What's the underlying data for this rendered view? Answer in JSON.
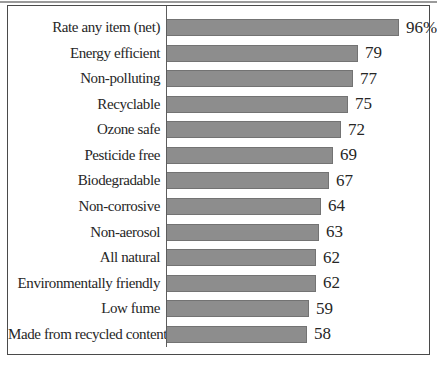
{
  "chart_data": {
    "type": "bar",
    "orientation": "horizontal",
    "title": "",
    "xlabel": "",
    "ylabel": "",
    "xlim": [
      0,
      96
    ],
    "grid": false,
    "legend": null,
    "categories": [
      "Rate any item (net)",
      "Energy efficient",
      "Non-polluting",
      "Recyclable",
      "Ozone safe",
      "Pesticide free",
      "Biodegradable",
      "Non-corrosive",
      "Non-aerosol",
      "All natural",
      "Environmentally friendly",
      "Low fume",
      "Made from recycled content"
    ],
    "values": [
      96,
      79,
      77,
      75,
      72,
      69,
      67,
      64,
      63,
      62,
      62,
      59,
      58
    ],
    "value_labels": [
      "96%",
      "79",
      "77",
      "75",
      "72",
      "69",
      "67",
      "64",
      "63",
      "62",
      "62",
      "59",
      "58"
    ],
    "colors": {
      "bar_fill": "#8d8d8d",
      "bar_border": "#737373",
      "frame_border": "#4a4a4a",
      "axis_line": "#5d5d5d",
      "text": "#262626",
      "top_rule": "#9a9a9a"
    }
  }
}
